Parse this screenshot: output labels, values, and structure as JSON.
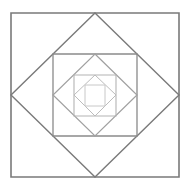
{
  "diagram": {
    "title": "",
    "center": [
      95,
      95
    ],
    "shapes": [
      {
        "name": "square-1",
        "type": "square",
        "points": "11,13 179,13 179,177 11,177",
        "stroke": "#7a7a7a",
        "width": 1.6
      },
      {
        "name": "diamond-1",
        "type": "diamond",
        "points": "95,13 179,95 95,177 11,95",
        "stroke": "#7a7a7a",
        "width": 1.4
      },
      {
        "name": "square-2",
        "type": "square",
        "points": "53,54 137,54 137,136 53,136",
        "stroke": "#8a8a8a",
        "width": 1.3
      },
      {
        "name": "diamond-2",
        "type": "diamond",
        "points": "95,54 137,95 95,136 53,95",
        "stroke": "#a0a0a0",
        "width": 1.2
      },
      {
        "name": "square-3",
        "type": "square",
        "points": "74,75 116,75 116,116 74,116",
        "stroke": "#b4b4b4",
        "width": 1.1
      },
      {
        "name": "diamond-3",
        "type": "diamond",
        "points": "95,75 116,95 95,116 74,95",
        "stroke": "#bcbcbc",
        "width": 1.0
      },
      {
        "name": "square-4",
        "type": "square",
        "points": "85,85 105,85 105,106 85,106",
        "stroke": "#c8c8c8",
        "width": 1.0
      }
    ]
  }
}
